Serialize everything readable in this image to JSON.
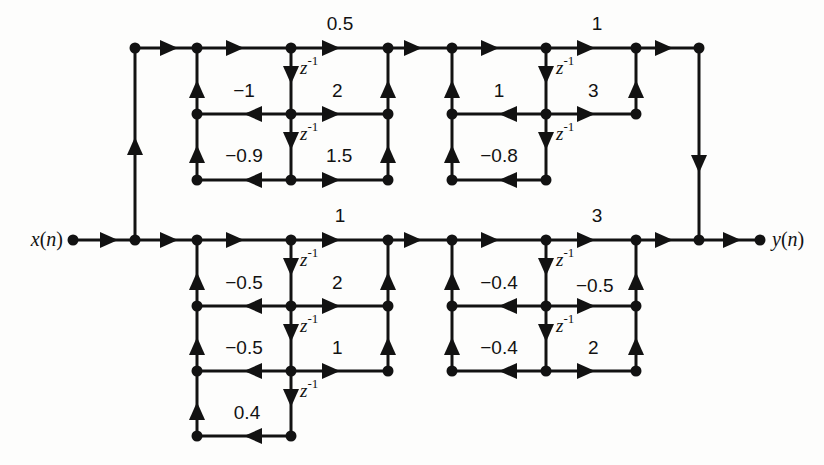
{
  "figure": {
    "type": "signal-flow-graph",
    "background_color": "#fdfdfc",
    "line_color": "#121212"
  },
  "io": {
    "input_label": "x(n)",
    "input_var": "x",
    "input_arg": "(n)",
    "output_label": "y(n)",
    "output_var": "y",
    "output_arg": "(n)"
  },
  "delay_symbol": {
    "base": "z",
    "exponent": "-1",
    "full": "z-1"
  },
  "sections": [
    {
      "id": "top-left",
      "name": "upper-branch-section-1",
      "order": 2,
      "ladder_top": "0.5",
      "reflection_coefficients": [
        "-1",
        "-0.9"
      ],
      "ladder_coefficients": [
        "2",
        "1.5"
      ],
      "delays": [
        "z-1",
        "z-1"
      ]
    },
    {
      "id": "top-right",
      "name": "upper-branch-section-2",
      "order": 2,
      "ladder_top": "1",
      "reflection_coefficients": [
        "1",
        "-0.8"
      ],
      "ladder_coefficients": [
        "3"
      ],
      "delays": [
        "z-1",
        "z-1"
      ]
    },
    {
      "id": "bottom-left",
      "name": "lower-branch-section-1",
      "order": 3,
      "ladder_top": "1",
      "reflection_coefficients": [
        "-0.5",
        "-0.5",
        "0.4"
      ],
      "ladder_coefficients": [
        "2",
        "1"
      ],
      "delays": [
        "z-1",
        "z-1",
        "z-1"
      ]
    },
    {
      "id": "bottom-right",
      "name": "lower-branch-section-2",
      "order": 2,
      "ladder_top": "3",
      "reflection_coefficients": [
        "-0.4",
        "-0.4"
      ],
      "ladder_coefficients": [
        "-0.5",
        "2"
      ],
      "delays": [
        "z-1",
        "z-1"
      ]
    }
  ],
  "labels": {
    "top_gain_s1": "0.5",
    "top_gain_s2": "1",
    "bot_gain_s3": "1",
    "bot_gain_s4": "3",
    "s1_k1": "-1",
    "s1_k2": "-0.9",
    "s1_v1": "2",
    "s1_v2": "1.5",
    "s2_k1": "1",
    "s2_k2": "-0.8",
    "s2_v1": "3",
    "s3_k1": "-0.5",
    "s3_k2": "-0.5",
    "s3_k3": "0.4",
    "s3_v1": "2",
    "s3_v2": "1",
    "s4_k1": "-0.4",
    "s4_k2": "-0.4",
    "s4_v1": "-0.5",
    "s4_v2": "2"
  }
}
